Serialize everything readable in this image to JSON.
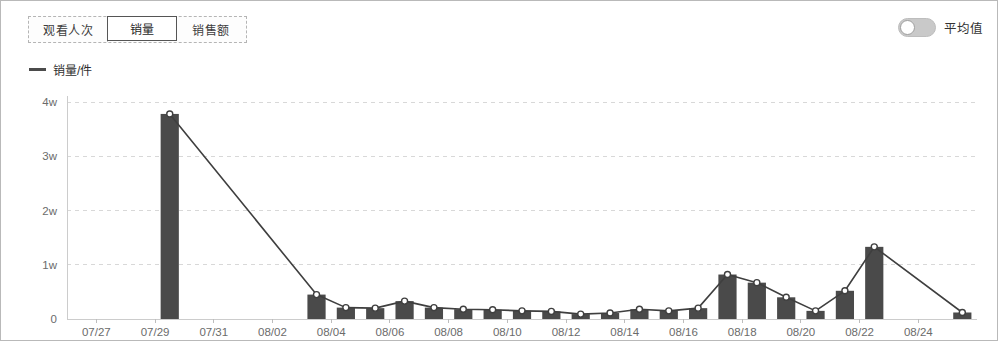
{
  "panel": {
    "border_color": "#b9b9b9",
    "background": "#ffffff"
  },
  "tabs": [
    {
      "label": "观看人次",
      "active": false
    },
    {
      "label": "销量",
      "active": true
    },
    {
      "label": "销售额",
      "active": false
    }
  ],
  "toggle": {
    "label": "平均值",
    "state": "off",
    "track_color": "#c9c9c9",
    "knob_color": "#ffffff"
  },
  "legend": {
    "label": "销量/件",
    "marker_color": "#4b4b4b"
  },
  "chart_data": {
    "type": "bar",
    "title": "",
    "subtitle": "",
    "xlabel": "",
    "ylabel": "",
    "grid": true,
    "legend_position": "top-left",
    "bar_color": "#4a4a4a",
    "line_color": "#3f3f3f",
    "marker_color": "#ffffff",
    "marker_edge_color": "#3f3f3f",
    "gridline_color": "#d8d8d8",
    "axis_color": "#cccccc",
    "ylim": [
      0,
      40000
    ],
    "ytick_values": [
      0,
      10000,
      20000,
      30000,
      40000
    ],
    "ytick_labels": [
      "0",
      "1w",
      "2w",
      "3w",
      "4w"
    ],
    "xtick_labels": [
      "07/27",
      "07/29",
      "07/31",
      "08/02",
      "08/04",
      "08/06",
      "08/08",
      "08/10",
      "08/12",
      "08/14",
      "08/16",
      "08/18",
      "08/20",
      "08/22",
      "08/24"
    ],
    "x_domain_start": "07/26",
    "x_domain_end": "08/26",
    "categories": [
      "07/29",
      "08/03",
      "08/04",
      "08/05",
      "08/06",
      "08/07",
      "08/08",
      "08/09",
      "08/10",
      "08/11",
      "08/12",
      "08/13",
      "08/14",
      "08/15",
      "08/16",
      "08/17",
      "08/18",
      "08/19",
      "08/20",
      "08/21",
      "08/22",
      "08/25"
    ],
    "series": [
      {
        "name": "销量/件",
        "values": [
          37800,
          4500,
          2100,
          2000,
          3300,
          2100,
          1800,
          1700,
          1500,
          1400,
          900,
          1100,
          1800,
          1500,
          2000,
          8200,
          6700,
          4000,
          1500,
          5200,
          13300,
          1200
        ]
      }
    ]
  }
}
